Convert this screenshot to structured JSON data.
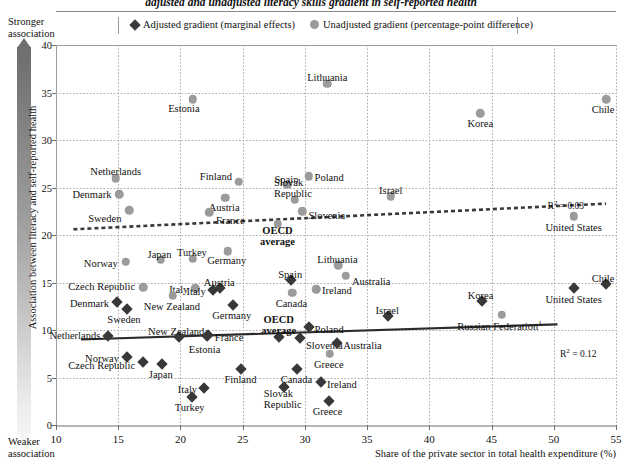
{
  "title": "adjusted and unadjusted literacy skills gradient in self-reported health",
  "legend": {
    "adjusted": "Adjusted gradient (marginal effects)",
    "unadjusted": "Unadjusted gradient (percentage-point difference)",
    "adjusted_icon": "diamond-marker-icon",
    "unadjusted_icon": "circle-marker-icon"
  },
  "axis_notes": {
    "top": "Stronger\nassociation",
    "top_line1": "Stronger",
    "top_line2": "association",
    "bottom_line1": "Weaker",
    "bottom_line2": "association"
  },
  "colors": {
    "adjusted_marker": "#383838",
    "unadjusted_marker": "#9b9b9b",
    "gridline": "#b0b0b0",
    "axis": "#9d9d9d",
    "trend_adjusted": "#2b2b2b",
    "trend_unadjusted": "#3a3a3a"
  },
  "chart_data": {
    "type": "scatter",
    "title": "adjusted and unadjusted literacy skills gradient in self-reported health",
    "xlabel": "Share of the private sector in total health expenditure (%)",
    "ylabel": "Association between literacy and self-reported health",
    "xlim": [
      10,
      55
    ],
    "ylim": [
      0,
      40
    ],
    "xticks": [
      10,
      15,
      20,
      25,
      30,
      35,
      40,
      45,
      50,
      55
    ],
    "yticks": [
      0,
      5,
      10,
      15,
      20,
      25,
      30,
      35,
      40
    ],
    "grid": true,
    "legend_position": "top",
    "annotations": [
      {
        "text": "R² = 0.03",
        "series": "Unadjusted gradient (percentage-point difference)",
        "x": 49.5,
        "y": 23.8
      },
      {
        "text": "R² = 0.12",
        "series": "Adjusted gradient (marginal effects)",
        "x": 50.5,
        "y": 8.2
      }
    ],
    "trendlines": [
      {
        "series": "Unadjusted gradient (percentage-point difference)",
        "style": "dashed",
        "x0": 11.4,
        "y0": 20.6,
        "x1": 54.2,
        "y1": 23.3,
        "r2": 0.03
      },
      {
        "series": "Adjusted gradient (marginal effects)",
        "style": "solid",
        "x0": 12.0,
        "y0": 9.0,
        "x1": 50.3,
        "y1": 10.6,
        "r2": 0.12
      }
    ],
    "series": [
      {
        "name": "Unadjusted gradient (percentage-point difference)",
        "marker": "circle",
        "points": [
          {
            "label": "Estonia",
            "x": 21.0,
            "y": 34.3,
            "lx": -9,
            "ly": 9,
            "anchor": "middle"
          },
          {
            "label": "Lithuania",
            "x": 31.8,
            "y": 35.9,
            "lx": 0,
            "ly": -7,
            "anchor": "middle"
          },
          {
            "label": "Korea",
            "x": 44.1,
            "y": 32.8,
            "lx": 0,
            "ly": 10,
            "anchor": "middle"
          },
          {
            "label": "Chile",
            "x": 54.2,
            "y": 34.3,
            "lx": -3,
            "ly": 10,
            "anchor": "middle"
          },
          {
            "label": "Netherlands",
            "x": 14.8,
            "y": 26.0,
            "lx": 0,
            "ly": -7,
            "anchor": "middle"
          },
          {
            "label": "Denmark",
            "x": 15.1,
            "y": 24.3,
            "lx": -8,
            "ly": 0,
            "anchor": "end"
          },
          {
            "label": "Sweden",
            "x": 15.9,
            "y": 22.6,
            "lx": -8,
            "ly": 8,
            "anchor": "end"
          },
          {
            "label": "Finland",
            "x": 24.7,
            "y": 25.6,
            "lx": -7,
            "ly": -6,
            "anchor": "end"
          },
          {
            "label": "Austria",
            "x": 23.6,
            "y": 23.9,
            "lx": -1,
            "ly": 9,
            "anchor": "middle"
          },
          {
            "label": "France",
            "x": 22.3,
            "y": 22.4,
            "lx": 7,
            "ly": 8,
            "anchor": "start"
          },
          {
            "label": "Spain",
            "x": 28.6,
            "y": 25.3,
            "lx": -1,
            "ly": -6,
            "anchor": "middle"
          },
          {
            "label": "Poland",
            "x": 30.3,
            "y": 26.2,
            "lx": 6,
            "ly": 1,
            "anchor": "start"
          },
          {
            "label": "Slovak Republic",
            "x": 29.2,
            "y": 23.7,
            "lx": -2,
            "ly": -12,
            "anchor": "middle"
          },
          {
            "label": "Slovenia",
            "x": 29.8,
            "y": 22.5,
            "lx": 6,
            "ly": 4,
            "anchor": "start"
          },
          {
            "label": "OECD average",
            "x": 27.8,
            "y": 21.2,
            "lx": 0,
            "ly": 12,
            "anchor": "middle",
            "bold": true
          },
          {
            "label": "Israel",
            "x": 36.9,
            "y": 24.1,
            "lx": 0,
            "ly": -6,
            "anchor": "middle"
          },
          {
            "label": "United States",
            "x": 51.6,
            "y": 22.0,
            "lx": 0,
            "ly": 11,
            "anchor": "middle"
          },
          {
            "label": "Norway",
            "x": 15.6,
            "y": 17.2,
            "lx": -8,
            "ly": 1,
            "anchor": "end"
          },
          {
            "label": "Japan",
            "x": 18.4,
            "y": 17.4,
            "lx": -1,
            "ly": -6,
            "anchor": "middle"
          },
          {
            "label": "Turkey",
            "x": 21.0,
            "y": 17.5,
            "lx": -1,
            "ly": -7,
            "anchor": "middle"
          },
          {
            "label": "Germany",
            "x": 23.8,
            "y": 18.3,
            "lx": -1,
            "ly": 9,
            "anchor": "middle"
          },
          {
            "label": "Czech Republic",
            "x": 17.0,
            "y": 14.5,
            "lx": -8,
            "ly": -1,
            "anchor": "end"
          },
          {
            "label": "Italy",
            "x": 21.2,
            "y": 14.4,
            "lx": -7,
            "ly": 1,
            "anchor": "end"
          },
          {
            "label": "New Zealand",
            "x": 19.4,
            "y": 13.6,
            "lx": -1,
            "ly": 10,
            "anchor": "middle"
          },
          {
            "label": "Canada",
            "x": 29.0,
            "y": 13.9,
            "lx": -1,
            "ly": 10,
            "anchor": "middle"
          },
          {
            "label": "Ireland",
            "x": 30.9,
            "y": 14.3,
            "lx": 6,
            "ly": 1,
            "anchor": "start"
          },
          {
            "label": "Lithuania",
            "x": 32.7,
            "y": 16.8,
            "lx": -1,
            "ly": -6,
            "anchor": "middle"
          },
          {
            "label": "Australia",
            "x": 33.3,
            "y": 15.7,
            "lx": 6,
            "ly": 5,
            "anchor": "start"
          },
          {
            "label": "Greece",
            "x": 32.0,
            "y": 7.5,
            "lx": -1,
            "ly": 10,
            "anchor": "middle"
          },
          {
            "label": "Russian Federation",
            "x": 45.8,
            "y": 11.6,
            "lx": -2,
            "ly": 10,
            "anchor": "middle",
            "dagger": true
          }
        ]
      },
      {
        "name": "Adjusted gradient (marginal effects)",
        "marker": "diamond",
        "points": [
          {
            "label": "Denmark",
            "x": 14.9,
            "y": 12.9,
            "lx": -8,
            "ly": 1,
            "anchor": "end"
          },
          {
            "label": "Sweden",
            "x": 15.7,
            "y": 12.2,
            "lx": -3,
            "ly": 10,
            "anchor": "middle"
          },
          {
            "label": "Netherlands",
            "x": 14.2,
            "y": 9.4,
            "lx": -8,
            "ly": -1,
            "anchor": "end"
          },
          {
            "label": "Norway",
            "x": 15.7,
            "y": 7.2,
            "lx": -8,
            "ly": 1,
            "anchor": "end"
          },
          {
            "label": "Czech Republic",
            "x": 17.0,
            "y": 6.6,
            "lx": -8,
            "ly": 3,
            "anchor": "end"
          },
          {
            "label": "Japan",
            "x": 18.5,
            "y": 6.4,
            "lx": -1,
            "ly": 10,
            "anchor": "middle"
          },
          {
            "label": "New Zealand",
            "x": 19.9,
            "y": 9.3,
            "lx": -3,
            "ly": -6,
            "anchor": "middle"
          },
          {
            "label": "France",
            "x": 22.2,
            "y": 9.5,
            "lx": 7,
            "ly": 2,
            "anchor": "start"
          },
          {
            "label": "Estonia",
            "x": 22.1,
            "y": 9.4,
            "lx": -2,
            "ly": 13,
            "anchor": "middle"
          },
          {
            "label": "Italy",
            "x": 22.6,
            "y": 14.2,
            "lx": -7,
            "ly": 1,
            "anchor": "end"
          },
          {
            "label": "Austria",
            "x": 23.2,
            "y": 14.4,
            "lx": -1,
            "ly": -6,
            "anchor": "middle"
          },
          {
            "label": "Germany",
            "x": 24.2,
            "y": 12.6,
            "lx": -1,
            "ly": 10,
            "anchor": "middle"
          },
          {
            "label": "Italy",
            "x": 21.9,
            "y": 3.9,
            "lx": -7,
            "ly": 1,
            "anchor": "end"
          },
          {
            "label": "Turkey",
            "x": 20.9,
            "y": 3.0,
            "lx": -2,
            "ly": 10,
            "anchor": "middle"
          },
          {
            "label": "Finland",
            "x": 24.9,
            "y": 5.9,
            "lx": -1,
            "ly": 10,
            "anchor": "middle"
          },
          {
            "label": "OECD average",
            "x": 27.9,
            "y": 9.3,
            "lx": 0,
            "ly": -12,
            "anchor": "middle",
            "bold": true
          },
          {
            "label": "Spain",
            "x": 28.9,
            "y": 15.3,
            "lx": -1,
            "ly": -6,
            "anchor": "middle"
          },
          {
            "label": "Slovenia",
            "x": 29.6,
            "y": 9.2,
            "lx": 6,
            "ly": 7,
            "anchor": "start"
          },
          {
            "label": "Poland",
            "x": 30.3,
            "y": 10.3,
            "lx": 6,
            "ly": 2,
            "anchor": "start"
          },
          {
            "label": "Canada",
            "x": 29.4,
            "y": 5.9,
            "lx": -1,
            "ly": 10,
            "anchor": "middle"
          },
          {
            "label": "Slovak Republic",
            "x": 28.3,
            "y": 4.0,
            "lx": -1,
            "ly": 12,
            "anchor": "middle"
          },
          {
            "label": "Greece",
            "x": 31.9,
            "y": 2.5,
            "lx": -1,
            "ly": 10,
            "anchor": "middle"
          },
          {
            "label": "Ireland",
            "x": 31.3,
            "y": 4.5,
            "lx": 6,
            "ly": 2,
            "anchor": "start"
          },
          {
            "label": "Australia",
            "x": 32.6,
            "y": 8.6,
            "lx": 6,
            "ly": 2,
            "anchor": "start"
          },
          {
            "label": "Israel",
            "x": 36.7,
            "y": 11.5,
            "lx": -1,
            "ly": -6,
            "anchor": "middle"
          },
          {
            "label": "Korea",
            "x": 44.2,
            "y": 13.1,
            "lx": -1,
            "ly": -6,
            "anchor": "middle"
          },
          {
            "label": "United States",
            "x": 51.6,
            "y": 14.4,
            "lx": 0,
            "ly": 11,
            "anchor": "middle"
          },
          {
            "label": "Chile",
            "x": 54.2,
            "y": 14.8,
            "lx": -3,
            "ly": -6,
            "anchor": "middle"
          }
        ]
      }
    ]
  }
}
